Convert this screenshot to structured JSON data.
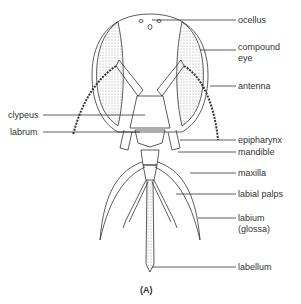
{
  "figure": {
    "caption": "(A)",
    "colors": {
      "line": "#333333",
      "label": "#333333",
      "stipple": "#888888",
      "background": "#ffffff"
    }
  },
  "labels": {
    "right": [
      {
        "id": "ocellus",
        "text": "ocellus",
        "y": 20
      },
      {
        "id": "compound-eye-1",
        "text": "compound",
        "y": 47
      },
      {
        "id": "compound-eye-2",
        "text": "eye",
        "y": 58
      },
      {
        "id": "antenna",
        "text": "antenna",
        "y": 86
      },
      {
        "id": "epipharynx",
        "text": "epipharynx",
        "y": 140
      },
      {
        "id": "mandible",
        "text": "mandible",
        "y": 152
      },
      {
        "id": "maxilla",
        "text": "maxilla",
        "y": 173
      },
      {
        "id": "labial-palps",
        "text": "labial palps",
        "y": 194
      },
      {
        "id": "labium-1",
        "text": "labium",
        "y": 218
      },
      {
        "id": "labium-2",
        "text": "(glossa)",
        "y": 229
      },
      {
        "id": "labellum",
        "text": "labellum",
        "y": 267
      }
    ],
    "left": [
      {
        "id": "clypeus",
        "text": "clypeus",
        "y": 115
      },
      {
        "id": "labrum",
        "text": "labrum",
        "y": 132
      }
    ]
  }
}
